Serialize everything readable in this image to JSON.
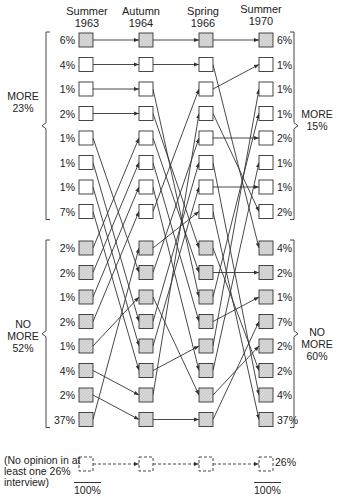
{
  "columns": [
    {
      "label_line1": "Summer",
      "label_line2": "1963"
    },
    {
      "label_line1": "Autumn",
      "label_line2": "1964"
    },
    {
      "label_line1": "Spring",
      "label_line2": "1966"
    },
    {
      "label_line1": "Summer",
      "label_line2": "1970"
    }
  ],
  "left_values": [
    "6%",
    "4%",
    "1%",
    "2%",
    "1%",
    "1%",
    "1%",
    "7%",
    "2%",
    "2%",
    "1%",
    "2%",
    "1%",
    "4%",
    "2%",
    "37%"
  ],
  "right_values": [
    "6%",
    "1%",
    "1%",
    "1%",
    "2%",
    "1%",
    "1%",
    "2%",
    "4%",
    "2%",
    "1%",
    "7%",
    "2%",
    "2%",
    "4%",
    "37%"
  ],
  "groups": {
    "left_more": {
      "line1": "MORE",
      "line2": "23%"
    },
    "left_no_more": {
      "line1": "NO",
      "line2": "MORE",
      "line3": "52%"
    },
    "right_more": {
      "line1": "MORE",
      "line2": "15%"
    },
    "right_no_more": {
      "line1": "NO",
      "line2": "MORE",
      "line3": "60%"
    }
  },
  "no_opinion": {
    "line1": "(No opinion in at",
    "line2": "least one",
    "value_left": "26%",
    "line3": "interview)",
    "value_right": "26%"
  },
  "totals": {
    "left": "100%",
    "right": "100%"
  },
  "colors": {
    "line": "#333333",
    "box_more": "#ffffff",
    "box_nomore": "#d6d6d6",
    "box_stable": "#cfcfcf"
  },
  "chart_data": {
    "type": "flow",
    "title": "",
    "waves": [
      "Summer 1963",
      "Autumn 1964",
      "Spring 1966",
      "Summer 1970"
    ],
    "states": [
      "MORE",
      "NO MORE"
    ],
    "paths_percent": [
      6,
      4,
      1,
      2,
      1,
      1,
      1,
      7,
      2,
      2,
      1,
      2,
      1,
      4,
      2,
      37,
      26
    ],
    "group_totals": {
      "start_more": 23,
      "start_no_more": 52,
      "end_more": 15,
      "end_no_more": 60,
      "no_opinion": 26,
      "total": 100
    }
  }
}
